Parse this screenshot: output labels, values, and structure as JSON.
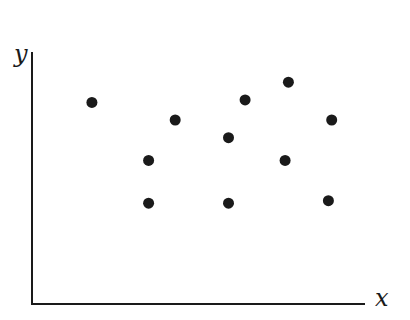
{
  "chart_data": {
    "type": "scatter",
    "title": "",
    "xlabel": "x",
    "ylabel": "y",
    "xlim": [
      0,
      10
    ],
    "ylim": [
      0,
      10
    ],
    "grid": false,
    "ticks": false,
    "legend": null,
    "point_color": "#1a1a1a",
    "points": [
      {
        "x": 1.8,
        "y": 8.0
      },
      {
        "x": 3.5,
        "y": 5.7
      },
      {
        "x": 3.5,
        "y": 4.0
      },
      {
        "x": 4.3,
        "y": 7.3
      },
      {
        "x": 5.9,
        "y": 6.6
      },
      {
        "x": 5.9,
        "y": 4.0
      },
      {
        "x": 6.4,
        "y": 8.1
      },
      {
        "x": 7.7,
        "y": 8.8
      },
      {
        "x": 7.6,
        "y": 5.7
      },
      {
        "x": 9.0,
        "y": 7.3
      },
      {
        "x": 8.9,
        "y": 4.1
      }
    ]
  }
}
